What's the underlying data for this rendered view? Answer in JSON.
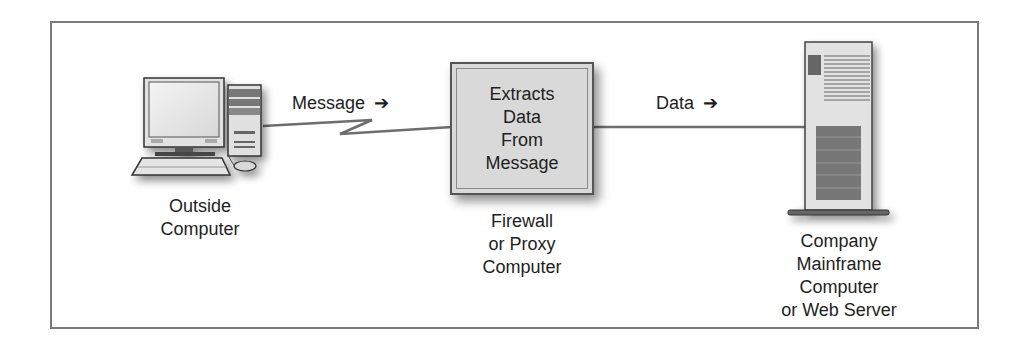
{
  "diagram": {
    "nodes": {
      "outside_computer": {
        "icon": "desktop-computer-icon",
        "label_lines": [
          "Outside",
          "Computer"
        ]
      },
      "firewall": {
        "box_text_lines": [
          "Extracts",
          "Data",
          "From",
          "Message"
        ],
        "label_lines": [
          "Firewall",
          "or Proxy",
          "Computer"
        ]
      },
      "server": {
        "icon": "tower-server-icon",
        "label_lines": [
          "Company",
          "Mainframe",
          "Computer",
          "or Web Server"
        ]
      }
    },
    "edges": {
      "message": {
        "label": "Message",
        "arrow": "➔",
        "style": "zigzag"
      },
      "data": {
        "label": "Data",
        "arrow": "➔",
        "style": "straight"
      }
    },
    "colors": {
      "frame": "#7a7a7a",
      "box_fill": "#d9d9d9",
      "line": "#6e6e6e",
      "text": "#1e1e1e"
    }
  }
}
